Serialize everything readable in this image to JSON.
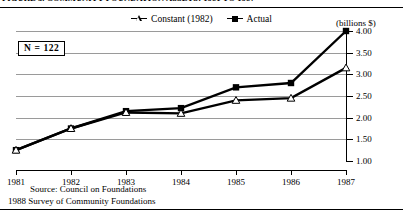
{
  "figure": {
    "title": "FIGURE 3. COMMUNITY FOUNDATION ASSETS: 1981 TO 1987",
    "units_label": "(billions  $)",
    "sample_note": "N = 122",
    "source_line1": "Source: Council on Foundations",
    "source_line2": "1988 Survey of Community Foundations"
  },
  "legend": {
    "items": [
      {
        "label": "Constant (1982)",
        "marker": "triangle-open",
        "color": "#000000"
      },
      {
        "label": "Actual",
        "marker": "square-filled",
        "color": "#000000"
      }
    ]
  },
  "chart_data": {
    "type": "line",
    "title": "FIGURE 3. COMMUNITY FOUNDATION ASSETS: 1981 TO 1987",
    "xlabel": "",
    "ylabel": "(billions  $)",
    "categories": [
      "1981",
      "1982",
      "1983",
      "1984",
      "1985",
      "1986",
      "1987"
    ],
    "x_tick_labels": [
      "1981",
      "1982",
      "1983",
      "1984",
      "1985",
      "1986",
      "1987"
    ],
    "y_tick_labels": [
      "1.00",
      "1.50",
      "2.00",
      "2.50",
      "3.00",
      "3.50",
      "4.00"
    ],
    "y_ticks": [
      1.0,
      1.5,
      2.0,
      2.5,
      3.0,
      3.5,
      4.0
    ],
    "ylim": [
      1.0,
      4.0
    ],
    "grid": true,
    "legend_position": "top-center",
    "series": [
      {
        "name": "Actual",
        "marker": "square-filled",
        "values": [
          1.25,
          1.75,
          2.15,
          2.22,
          2.7,
          2.8,
          4.0
        ]
      },
      {
        "name": "Constant (1982)",
        "marker": "triangle-open",
        "values": [
          1.25,
          1.75,
          2.12,
          2.1,
          2.4,
          2.45,
          3.15
        ]
      }
    ],
    "annotations": [
      {
        "text": "N = 122",
        "type": "box",
        "position": "upper-left"
      }
    ]
  }
}
